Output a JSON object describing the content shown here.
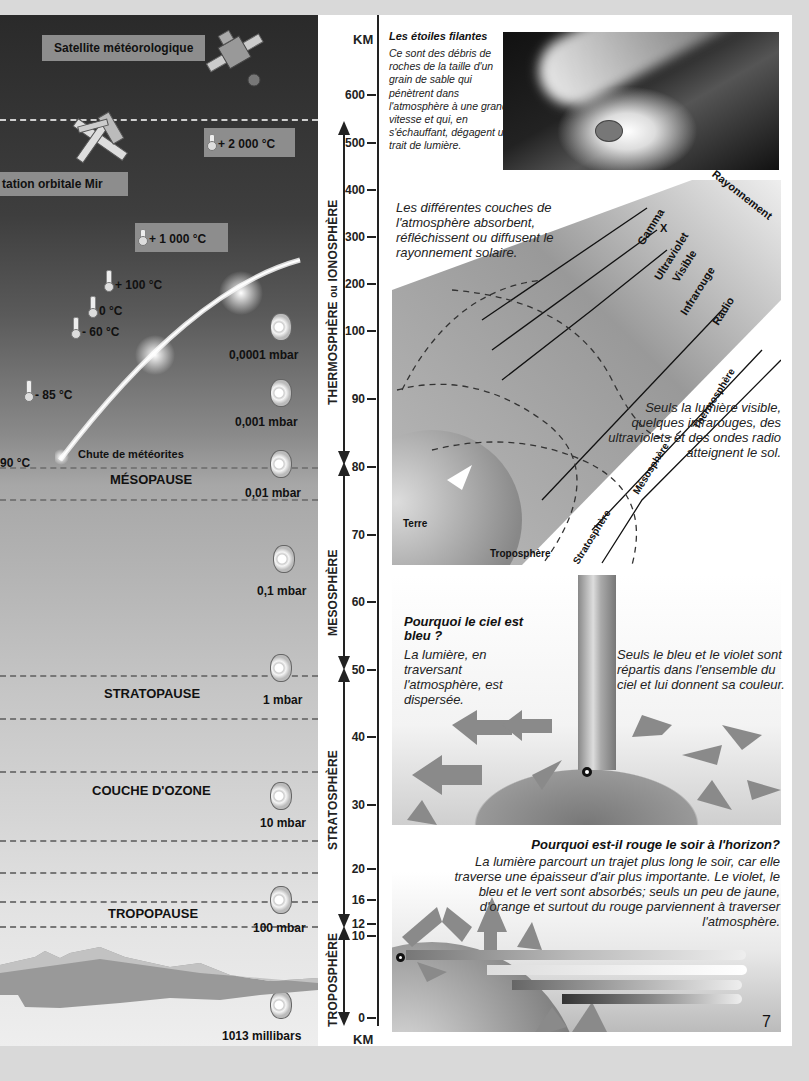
{
  "page": {
    "number": "7",
    "background": "#d9d9d9"
  },
  "left_panel": {
    "satellite_label": "Satellite météorologique",
    "mir_label": "tation orbitale Mir",
    "temperatures": [
      {
        "id": "t2000",
        "value": "+ 2 000 °C",
        "boxed": true
      },
      {
        "id": "t1000",
        "value": "+ 1 000 °C",
        "boxed": true
      },
      {
        "id": "t100",
        "value": "+ 100 °C"
      },
      {
        "id": "t0",
        "value": "0 °C"
      },
      {
        "id": "tm60",
        "value": "- 60 °C"
      },
      {
        "id": "tm85",
        "value": "- 85 °C"
      },
      {
        "id": "tm90",
        "value": "90 °C"
      }
    ],
    "meteor_label": "Chute de météorites",
    "layers": {
      "mesopause": "MÉSOPAUSE",
      "stratopause": "STRATOPAUSE",
      "ozone": "COUCHE D'OZONE",
      "tropopause": "TROPOPAUSE"
    },
    "pressures": [
      "0,0001 mbar",
      "0,001 mbar",
      "0,01 mbar",
      "0,1 mbar",
      "1 mbar",
      "10 mbar",
      "100 mbar",
      "1013 millibars"
    ]
  },
  "altitude_scale": {
    "unit_top": "KM",
    "unit_bottom": "KM",
    "ticks": [
      "600",
      "500",
      "400",
      "300",
      "200",
      "100",
      "90",
      "80",
      "70",
      "60",
      "50",
      "40",
      "30",
      "20",
      "16",
      "12",
      "10",
      "0"
    ],
    "spheres": {
      "thermo_a": "THERMOSPHÈRE",
      "thermo_ou": "ou",
      "thermo_b": "IONOSPHÈRE",
      "meso": "MESOSPHÈRE",
      "strato": "STRATOSPHÈRE",
      "tropo": "TROPOSPHÈRE"
    }
  },
  "shooting_stars": {
    "title": "Les étoiles filantes",
    "text": "Ce sont des débris de roches de la taille d'un grain de sable qui pénètrent dans l'atmosphère à une grande vitesse et qui, en s'échauffant, dégagent un trait de lumière."
  },
  "radiation": {
    "intro": "Les différentes couches de l'atmosphère absorbent, réfléchissent ou diffusent le rayonnement solaire.",
    "header": "Rayonnement",
    "bands": [
      "Gamma",
      "X",
      "Ultraviolet",
      "Visible",
      "Infrarouge",
      "Radio"
    ],
    "layers": [
      "Thermosphère",
      "Mésosphère",
      "Stratosphère",
      "Troposphère"
    ],
    "earth": "Terre",
    "conclusion": "Seuls la lumière visible, quelques infrarouges, des ultraviolets et des ondes radio atteignent le sol."
  },
  "blue_sky": {
    "title": "Pourquoi le ciel est bleu ?",
    "left_text": "La lumière, en traversant l'atmosphère, est dispersée.",
    "right_text": "Seuls le bleu et le violet sont répartis dans l'ensemble du ciel et lui donnent sa couleur."
  },
  "red_sunset": {
    "title": "Pourquoi est-il rouge le soir à l'horizon?",
    "text": "La lumière parcourt un trajet plus long le soir, car elle traverse une épaisseur d'air plus importante. Le violet, le bleu et le vert sont absorbés; seuls un peu de jaune, d'orange et surtout du rouge parviennent à traverser l'atmosphère."
  }
}
